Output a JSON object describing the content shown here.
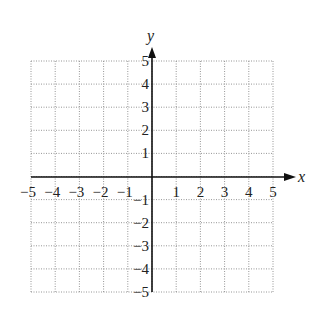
{
  "chart_data": {
    "type": "scatter",
    "title": "",
    "xlabel": "x",
    "ylabel": "y",
    "xlim": [
      -5,
      5
    ],
    "ylim": [
      -5,
      5
    ],
    "grid": true,
    "grid_style": "dotted",
    "x_ticks": [
      "−5",
      "−4",
      "−3",
      "−2",
      "−1",
      "1",
      "2",
      "3",
      "4",
      "5"
    ],
    "y_ticks": [
      "5",
      "4",
      "3",
      "2",
      "1",
      "−1",
      "−2",
      "−3",
      "−4",
      "−5"
    ],
    "series": []
  },
  "axes": {
    "x_label": "x",
    "y_label": "y"
  }
}
